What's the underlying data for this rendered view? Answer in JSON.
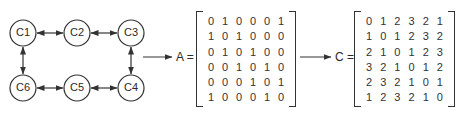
{
  "graph": {
    "nodes": [
      {
        "id": "C1",
        "label": "C1",
        "x": 23,
        "y": 33
      },
      {
        "id": "C2",
        "label": "C2",
        "x": 77,
        "y": 33
      },
      {
        "id": "C3",
        "label": "C3",
        "x": 131,
        "y": 33
      },
      {
        "id": "C4",
        "label": "C4",
        "x": 131,
        "y": 88
      },
      {
        "id": "C5",
        "label": "C5",
        "x": 77,
        "y": 88
      },
      {
        "id": "C6",
        "label": "C6",
        "x": 23,
        "y": 88
      }
    ],
    "edges": [
      [
        "C1",
        "C2"
      ],
      [
        "C2",
        "C3"
      ],
      [
        "C3",
        "C4"
      ],
      [
        "C4",
        "C5"
      ],
      [
        "C5",
        "C6"
      ],
      [
        "C6",
        "C1"
      ]
    ],
    "edge_style": "bidirectional-arrow"
  },
  "matrix_a": {
    "label": "A =",
    "rows": [
      [
        "0",
        "1",
        "0",
        "0",
        "0",
        "1"
      ],
      [
        "1",
        "0",
        "1",
        "0",
        "0",
        "0"
      ],
      [
        "0",
        "1",
        "0",
        "1",
        "0",
        "0"
      ],
      [
        "0",
        "0",
        "1",
        "0",
        "1",
        "0"
      ],
      [
        "0",
        "0",
        "0",
        "1",
        "0",
        "1"
      ],
      [
        "1",
        "0",
        "0",
        "0",
        "1",
        "0"
      ]
    ]
  },
  "matrix_c": {
    "label": "C =",
    "rows": [
      [
        "0",
        "1",
        "2",
        "3",
        "2",
        "1"
      ],
      [
        "1",
        "0",
        "1",
        "2",
        "3",
        "2"
      ],
      [
        "2",
        "1",
        "0",
        "1",
        "2",
        "3"
      ],
      [
        "3",
        "2",
        "1",
        "0",
        "1",
        "2"
      ],
      [
        "2",
        "3",
        "2",
        "1",
        "0",
        "1"
      ],
      [
        "1",
        "2",
        "3",
        "2",
        "1",
        "0"
      ]
    ]
  },
  "colors": {
    "stroke": "#333333",
    "text": "#2a2a2a",
    "background": "#ffffff"
  }
}
